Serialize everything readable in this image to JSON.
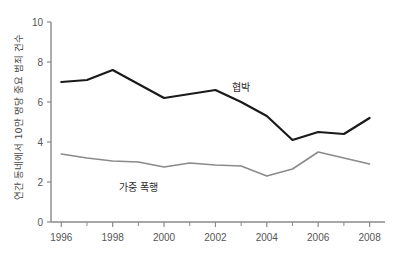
{
  "chart_data": {
    "type": "line",
    "title": "",
    "subtitle": "",
    "xlabel": "",
    "ylabel": "연간 동네에서 10만 명당 중요 범죄 건수",
    "x": [
      1996,
      1997,
      1998,
      1999,
      2000,
      2001,
      2002,
      2003,
      2004,
      2005,
      2006,
      2007,
      2008
    ],
    "xlim": [
      1995.6,
      2008.6
    ],
    "ylim": [
      0,
      10
    ],
    "xticks_major": [
      1996,
      1998,
      2000,
      2002,
      2004,
      2006,
      2008
    ],
    "xticklabels": [
      "1996",
      "1998",
      "2000",
      "2002",
      "2004",
      "2006",
      "2008"
    ],
    "xticks_minor": [
      1997,
      1999,
      2001,
      2003,
      2005,
      2007
    ],
    "yticks": [
      0,
      2,
      4,
      6,
      8,
      10
    ],
    "yticklabels": [
      "0",
      "2",
      "4",
      "6",
      "8",
      "10"
    ],
    "grid": false,
    "legend_position": "inline-annotation",
    "series": [
      {
        "name": "협박",
        "color": "#1a1a1a",
        "width": 2.2,
        "values": [
          7.0,
          7.1,
          7.6,
          6.9,
          6.2,
          6.4,
          6.6,
          6.0,
          5.3,
          4.1,
          4.5,
          4.4,
          5.2
        ],
        "annotation": {
          "label": "협박",
          "x": 2003.0,
          "y": 6.55
        }
      },
      {
        "name": "가중 폭행",
        "color": "#8a8a8a",
        "width": 1.5,
        "values": [
          3.4,
          3.2,
          3.05,
          3.0,
          2.75,
          2.95,
          2.85,
          2.8,
          2.3,
          2.65,
          3.5,
          3.2,
          2.9
        ],
        "annotation": {
          "label": "가중 폭행",
          "x": 1999.0,
          "y": 1.55
        }
      }
    ],
    "axis_color": "#8a8a8a",
    "text_color": "#555555",
    "background": "#ffffff"
  }
}
